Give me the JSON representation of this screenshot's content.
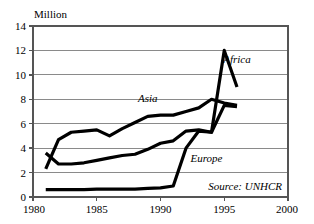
{
  "chart_data": {
    "type": "line",
    "title": "",
    "subtitle": "",
    "unit_label": "Million",
    "xlabel": "",
    "ylabel": "",
    "xlim": [
      1980,
      2000
    ],
    "ylim": [
      0,
      14
    ],
    "xticks": [
      "1980",
      "1985",
      "1990",
      "1995",
      "2000"
    ],
    "xtick_values": [
      1980,
      1985,
      1990,
      1995,
      2000
    ],
    "yticks": [
      "0",
      "2",
      "4",
      "6",
      "8",
      "10",
      "12",
      "14"
    ],
    "ytick_values": [
      0,
      2,
      4,
      6,
      8,
      10,
      12,
      14
    ],
    "grid": "horizontal",
    "legend_position": "inline-annotation",
    "source": "Source: UNHCR",
    "series": [
      {
        "name": "Asia",
        "label": "Asia",
        "color": "#000000",
        "x": [
          1981,
          1982,
          1983,
          1984,
          1985,
          1986,
          1987,
          1988,
          1989,
          1990,
          1991,
          1992,
          1993,
          1994,
          1995,
          1996
        ],
        "values": [
          2.3,
          4.7,
          5.3,
          5.4,
          5.5,
          5.0,
          5.6,
          6.1,
          6.6,
          6.7,
          6.7,
          7.0,
          7.3,
          8.0,
          7.7,
          7.5
        ]
      },
      {
        "name": "Africa",
        "label": "Africa",
        "color": "#000000",
        "x": [
          1981,
          1982,
          1983,
          1984,
          1985,
          1986,
          1987,
          1988,
          1989,
          1990,
          1991,
          1992,
          1993,
          1994,
          1995,
          1996
        ],
        "values": [
          3.6,
          2.7,
          2.7,
          2.8,
          3.0,
          3.2,
          3.4,
          3.5,
          3.9,
          4.4,
          4.6,
          5.4,
          5.5,
          5.3,
          12.0,
          9.0
        ]
      },
      {
        "name": "Europe",
        "label": "Europe",
        "color": "#000000",
        "x": [
          1981,
          1982,
          1983,
          1984,
          1985,
          1986,
          1987,
          1988,
          1989,
          1990,
          1991,
          1992,
          1993,
          1994,
          1995,
          1996
        ],
        "values": [
          0.6,
          0.6,
          0.6,
          0.6,
          0.65,
          0.65,
          0.65,
          0.65,
          0.7,
          0.75,
          0.9,
          4.0,
          5.4,
          5.3,
          7.5,
          7.4
        ]
      }
    ],
    "annotations": [
      {
        "text": "Asia",
        "x": 1989,
        "y": 7.8
      },
      {
        "text": "Africa",
        "x": 1996,
        "y": 11.0
      },
      {
        "text": "Europe",
        "x": 1993.6,
        "y": 2.9
      }
    ]
  }
}
